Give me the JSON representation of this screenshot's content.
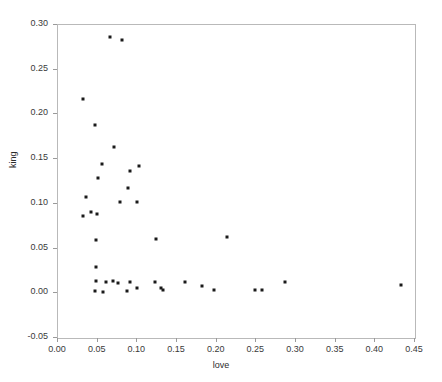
{
  "chart_data": {
    "type": "scatter",
    "title": "",
    "xlabel": "love",
    "ylabel": "king",
    "xlim": [
      0.0,
      0.45
    ],
    "ylim": [
      -0.05,
      0.3
    ],
    "xticks": [
      "0.00",
      "0.05",
      "0.10",
      "0.15",
      "0.20",
      "0.25",
      "0.30",
      "0.35",
      "0.40",
      "0.45"
    ],
    "xtick_values": [
      0.0,
      0.05,
      0.1,
      0.15,
      0.2,
      0.25,
      0.3,
      0.35,
      0.4,
      0.45
    ],
    "yticks": [
      "-0.05",
      "0.00",
      "0.05",
      "0.10",
      "0.15",
      "0.20",
      "0.25",
      "0.30"
    ],
    "ytick_values": [
      -0.05,
      0.0,
      0.05,
      0.1,
      0.15,
      0.2,
      0.25,
      0.3
    ],
    "grid": false,
    "legend": false,
    "marker": "square",
    "marker_color": "#1a1a1a",
    "marker_size_px": 3,
    "frame_color": "#b9b9b9",
    "background": "#ffffff",
    "points": [
      {
        "x": 0.067,
        "y": 0.285
      },
      {
        "x": 0.082,
        "y": 0.282
      },
      {
        "x": 0.033,
        "y": 0.216
      },
      {
        "x": 0.048,
        "y": 0.187
      },
      {
        "x": 0.072,
        "y": 0.163
      },
      {
        "x": 0.057,
        "y": 0.144
      },
      {
        "x": 0.103,
        "y": 0.141
      },
      {
        "x": 0.092,
        "y": 0.136
      },
      {
        "x": 0.052,
        "y": 0.128
      },
      {
        "x": 0.089,
        "y": 0.117
      },
      {
        "x": 0.037,
        "y": 0.106
      },
      {
        "x": 0.079,
        "y": 0.101
      },
      {
        "x": 0.101,
        "y": 0.101
      },
      {
        "x": 0.033,
        "y": 0.085
      },
      {
        "x": 0.043,
        "y": 0.09
      },
      {
        "x": 0.05,
        "y": 0.087
      },
      {
        "x": 0.049,
        "y": 0.058
      },
      {
        "x": 0.125,
        "y": 0.06
      },
      {
        "x": 0.214,
        "y": 0.062
      },
      {
        "x": 0.049,
        "y": 0.028
      },
      {
        "x": 0.049,
        "y": 0.013
      },
      {
        "x": 0.062,
        "y": 0.012
      },
      {
        "x": 0.071,
        "y": 0.013
      },
      {
        "x": 0.077,
        "y": 0.01
      },
      {
        "x": 0.092,
        "y": 0.012
      },
      {
        "x": 0.101,
        "y": 0.005
      },
      {
        "x": 0.123,
        "y": 0.011
      },
      {
        "x": 0.131,
        "y": 0.005
      },
      {
        "x": 0.134,
        "y": 0.003
      },
      {
        "x": 0.161,
        "y": 0.012
      },
      {
        "x": 0.183,
        "y": 0.007
      },
      {
        "x": 0.198,
        "y": 0.003
      },
      {
        "x": 0.048,
        "y": 0.001
      },
      {
        "x": 0.058,
        "y": 0.0
      },
      {
        "x": 0.088,
        "y": 0.001
      },
      {
        "x": 0.25,
        "y": 0.002
      },
      {
        "x": 0.258,
        "y": 0.003
      },
      {
        "x": 0.287,
        "y": 0.012
      },
      {
        "x": 0.433,
        "y": 0.008
      }
    ]
  }
}
